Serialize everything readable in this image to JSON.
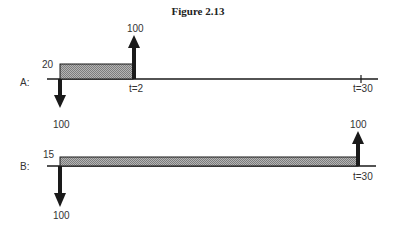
{
  "title": "Figure 2.13",
  "colors": {
    "line": "#1a1a1a",
    "hatch": "#9a9a9a",
    "text": "#333333"
  },
  "diagrams": [
    {
      "id": "A",
      "label": "A:",
      "box_height_label": "20",
      "up_arrow_value": "100",
      "down_arrow_value": "100",
      "time_labels": [
        "t=2",
        "t=30"
      ]
    },
    {
      "id": "B",
      "label": "B:",
      "box_height_label": "15",
      "up_arrow_value": "100",
      "down_arrow_value": "100",
      "time_labels": [
        "t=30"
      ]
    }
  ]
}
